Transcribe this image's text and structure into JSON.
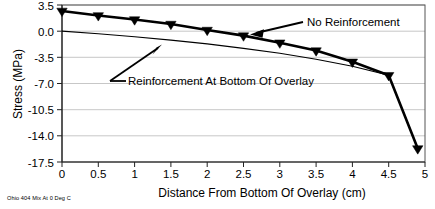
{
  "chart_data": {
    "type": "line",
    "title": "",
    "xlabel": "Distance From Bottom Of Overlay (cm)",
    "ylabel": "Stress (MPa)",
    "xlim": [
      0,
      5
    ],
    "ylim": [
      -17.5,
      3.5
    ],
    "grid": true,
    "legend_position": "inline-annotations",
    "xticks": [
      "0",
      "0.5",
      "1",
      "1.5",
      "2",
      "2.5",
      "3",
      "3.5",
      "4",
      "4.5",
      "5"
    ],
    "xtick_values": [
      0,
      0.5,
      1,
      1.5,
      2,
      2.5,
      3,
      3.5,
      4,
      4.5,
      5
    ],
    "yticks": [
      "3.5",
      "0.0",
      "-3.5",
      "-7.0",
      "-10.5",
      "-14.0",
      "-17.5"
    ],
    "ytick_values": [
      3.5,
      0.0,
      -3.5,
      -7.0,
      -10.5,
      -14.0,
      -17.5
    ],
    "x": [
      0,
      0.5,
      1,
      1.5,
      2,
      2.5,
      3,
      3.5,
      4,
      4.5,
      4.9
    ],
    "series": [
      {
        "name": "No Reinforcement",
        "style": "bold-with-triangle-markers",
        "marker": "triangle-down",
        "values": [
          2.7,
          2.1,
          1.55,
          0.95,
          0.15,
          -0.6,
          -1.55,
          -2.6,
          -4.1,
          -5.9,
          -15.7
        ]
      },
      {
        "name": "Reinforcement At Bottom Of Overlay",
        "style": "thin-no-markers",
        "marker": "none",
        "values": [
          0.0,
          -0.35,
          -0.75,
          -1.2,
          -1.7,
          -2.3,
          -2.95,
          -3.75,
          -4.7,
          -5.9,
          -15.7
        ]
      }
    ],
    "annotations": [
      {
        "name": "No Reinforcement",
        "text": "No Reinforcement",
        "label_x": 3.1,
        "label_y": 2.55,
        "point_x": 2.25,
        "point_y": 0.0
      },
      {
        "name": "Reinforcement At Bottom Of Overlay",
        "text": "Reinforcement At Bottom Of Overlay",
        "label_x": 0.98,
        "label_y": -4.55,
        "point_x": 1.36,
        "point_y": -1.1
      }
    ],
    "footnote": "Ohio 404 Mix At 0 Deg C",
    "colors": {
      "series_line": "#000000",
      "gridline": "#b9b9b9",
      "frame": "#555555",
      "text": "#000000",
      "background": "#ffffff"
    }
  }
}
